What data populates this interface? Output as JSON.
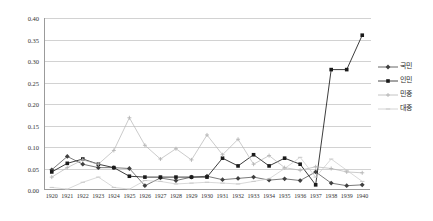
{
  "chart_data": {
    "type": "line",
    "title": "",
    "xlabel": "",
    "ylabel": "",
    "ylim": [
      0.0,
      0.4
    ],
    "ytick_labels": [
      "0.00",
      "0.05",
      "0.10",
      "0.15",
      "0.20",
      "0.25",
      "0.30",
      "0.35",
      "0.40"
    ],
    "ytick_values": [
      0.0,
      0.05,
      0.1,
      0.15,
      0.2,
      0.25,
      0.3,
      0.35,
      0.4
    ],
    "grid": true,
    "legend_position": "right",
    "categories": [
      "1920",
      "1921",
      "1922",
      "1923",
      "1924",
      "1925",
      "1926",
      "1927",
      "1928",
      "1929",
      "1930",
      "1931",
      "1932",
      "1933",
      "1934",
      "1935",
      "1936",
      "1937",
      "1938",
      "1939",
      "1940"
    ],
    "series": [
      {
        "name": "국민",
        "marker": "diamond",
        "color": "#404040",
        "values": [
          0.047,
          0.078,
          0.06,
          0.052,
          0.052,
          0.05,
          0.01,
          0.028,
          0.022,
          0.03,
          0.032,
          0.024,
          0.027,
          0.03,
          0.023,
          0.026,
          0.022,
          0.042,
          0.016,
          0.01,
          0.012
        ]
      },
      {
        "name": "인민",
        "marker": "square",
        "color": "#1a1a1a",
        "values": [
          0.042,
          0.062,
          0.072,
          0.06,
          0.052,
          0.032,
          0.03,
          0.03,
          0.03,
          0.03,
          0.03,
          0.074,
          0.056,
          0.082,
          0.056,
          0.074,
          0.06,
          0.012,
          0.28,
          0.28,
          0.36
        ]
      },
      {
        "name": "민중",
        "marker": "cross",
        "color": "#b5b5b5",
        "values": [
          0.03,
          0.052,
          0.07,
          0.06,
          0.092,
          0.168,
          0.104,
          0.072,
          0.096,
          0.07,
          0.128,
          0.082,
          0.118,
          0.06,
          0.08,
          0.052,
          0.046,
          0.054,
          0.05,
          0.042,
          0.04
        ]
      },
      {
        "name": "대중",
        "marker": "dash",
        "color": "#c9c9c9",
        "values": [
          0.006,
          0.002,
          0.018,
          0.03,
          0.006,
          0.002,
          0.022,
          0.02,
          0.014,
          0.016,
          0.018,
          0.016,
          0.014,
          0.02,
          0.026,
          0.05,
          0.076,
          0.03,
          0.072,
          0.046,
          0.02
        ]
      }
    ]
  },
  "legend": {
    "items": [
      {
        "label": "국민"
      },
      {
        "label": "인민"
      },
      {
        "label": "민중"
      },
      {
        "label": "대중"
      }
    ]
  }
}
